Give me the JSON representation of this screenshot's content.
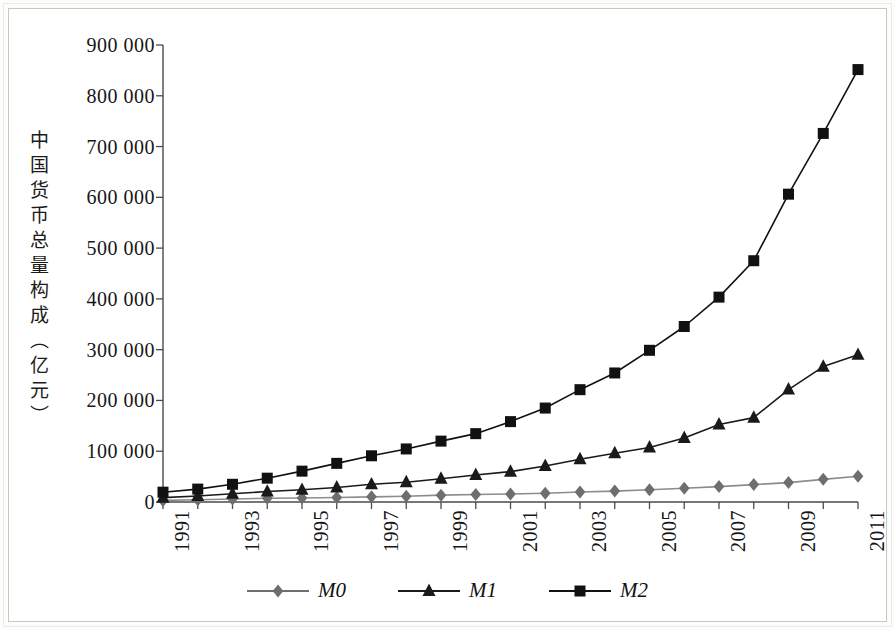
{
  "chart_data": {
    "type": "line",
    "title": "",
    "subtitle": "",
    "xlabel": "",
    "ylabel": "中国货币总量构成（亿元）",
    "ylabel_chars": [
      "中",
      "国",
      "货",
      "币",
      "总",
      "量",
      "构",
      "成",
      "（",
      "亿",
      "元",
      "）"
    ],
    "x": [
      1991,
      1992,
      1993,
      1994,
      1995,
      1996,
      1997,
      1998,
      1999,
      2000,
      2001,
      2002,
      2003,
      2004,
      2005,
      2006,
      2007,
      2008,
      2009,
      2010,
      2011
    ],
    "xtick_labels": [
      "1991",
      "1993",
      "1995",
      "1997",
      "1999",
      "2001",
      "2003",
      "2005",
      "2007",
      "2009",
      "2011"
    ],
    "xtick_values": [
      1991,
      1993,
      1995,
      1997,
      1999,
      2001,
      2003,
      2005,
      2007,
      2009,
      2011
    ],
    "ytick_labels": [
      "900 000",
      "800 000",
      "700 000",
      "600 000",
      "500 000",
      "400 000",
      "300 000",
      "200 000",
      "100 000",
      "0"
    ],
    "ytick_values": [
      900000,
      800000,
      700000,
      600000,
      500000,
      400000,
      300000,
      200000,
      100000,
      0
    ],
    "ylim": [
      0,
      900000
    ],
    "xlim": [
      1991,
      2011
    ],
    "grid": false,
    "legend_position": "bottom",
    "series": [
      {
        "name": "M0",
        "marker": "diamond",
        "color": "#6e6e6e",
        "line_color": "#8c8c8c",
        "values": [
          3178,
          4336,
          5865,
          7289,
          7885,
          8802,
          10178,
          11204,
          13456,
          14653,
          15689,
          17278,
          19746,
          21468,
          24032,
          27073,
          30375,
          34219,
          38246,
          44628,
          50748
        ]
      },
      {
        "name": "M1",
        "marker": "triangle",
        "color": "#1a1a1a",
        "line_color": "#1a1a1a",
        "values": [
          8633,
          11732,
          16280,
          20540,
          23987,
          28515,
          34826,
          38954,
          45837,
          53147,
          59872,
          70882,
          84119,
          95971,
          107279,
          126035,
          152560,
          166217,
          221446,
          266622,
          289848
        ]
      },
      {
        "name": "M2",
        "marker": "square",
        "color": "#111111",
        "line_color": "#111111",
        "values": [
          19350,
          25402,
          34880,
          46924,
          60750,
          76095,
          90996,
          104499,
          119898,
          134610,
          158302,
          185007,
          221223,
          254107,
          298756,
          345604,
          403442,
          475167,
          606225,
          725852,
          851591
        ]
      }
    ]
  },
  "legend": {
    "items": [
      {
        "label": "M0",
        "marker": "diamond",
        "color": "#6e6e6e"
      },
      {
        "label": "M1",
        "marker": "triangle",
        "color": "#1a1a1a"
      },
      {
        "label": "M2",
        "marker": "square",
        "color": "#111111"
      }
    ]
  },
  "axis": {
    "axis_color": "#4a4a4a"
  }
}
